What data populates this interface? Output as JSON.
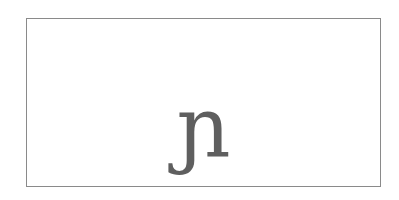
{
  "card": {
    "glyph": "ɲ",
    "glyph_color": "#5f5f5f",
    "border_color": "#8a8a8a"
  }
}
